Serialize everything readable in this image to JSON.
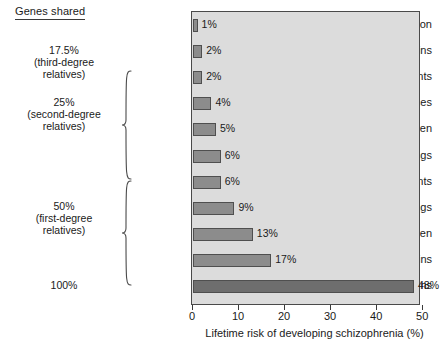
{
  "header": {
    "genes_shared_label": "Genes shared"
  },
  "groups": [
    {
      "name": "third-degree",
      "lines": [
        "17.5%",
        "(third-degree",
        "relatives)"
      ],
      "top": 44,
      "brace": null
    },
    {
      "name": "second-degree",
      "lines": [
        "25%",
        "(second-degree",
        "relatives)"
      ],
      "top": 96,
      "brace": {
        "top": 70,
        "height": 110
      }
    },
    {
      "name": "first-degree",
      "lines": [
        "50%",
        "(first-degree",
        "relatives)"
      ],
      "top": 200,
      "brace": {
        "top": 180,
        "height": 106
      }
    },
    {
      "name": "identical",
      "lines": [
        "100%"
      ],
      "top": 279,
      "brace": null
    }
  ],
  "chart_data": {
    "type": "bar",
    "orientation": "horizontal",
    "title": "",
    "xlabel": "Lifetime risk of developing schizophrenia (%)",
    "ylabel": "",
    "xlim": [
      0,
      50
    ],
    "xticks": [
      0,
      10,
      20,
      30,
      40,
      50
    ],
    "xtick_labels": [
      "0",
      "10",
      "20",
      "30",
      "40",
      "50"
    ],
    "grid": false,
    "legend": false,
    "categories": [
      "General population",
      "First cousins",
      "Uncles, aunts",
      "Nephews, nieces",
      "Grandchildren",
      "Half-siblings",
      "Parents",
      "Siblings",
      "Children",
      "Fraternal twins",
      "Identical twins"
    ],
    "values": [
      1,
      2,
      2,
      4,
      5,
      6,
      6,
      9,
      13,
      17,
      48
    ],
    "value_labels": [
      "1%",
      "2%",
      "2%",
      "4%",
      "5%",
      "6%",
      "6%",
      "9%",
      "13%",
      "17%",
      "48%"
    ],
    "colors": {
      "bar_fill": "#8c8c8c",
      "bar_fill_highlight": "#6e6e6e",
      "bar_stroke": "#4f4f4f",
      "plot_background": "#dcdcdc",
      "page_background": "#ffffff",
      "text": "#1a1a1a"
    }
  }
}
